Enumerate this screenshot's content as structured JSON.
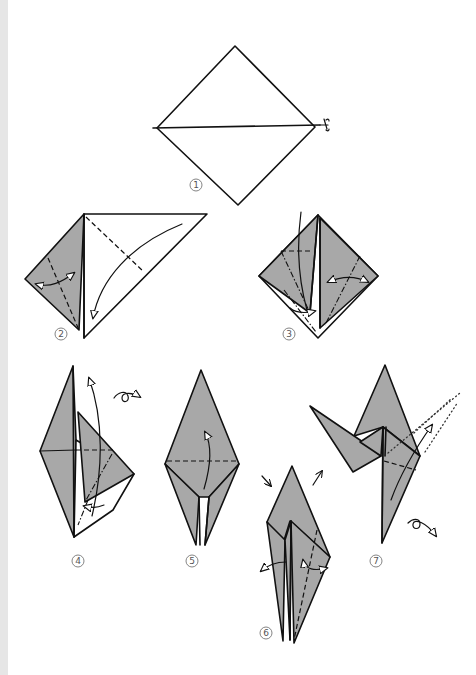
{
  "diagram": {
    "type": "origami instructions",
    "colors": {
      "paper_colored_side": "#a8a8a8",
      "paper_white_side": "#ffffff",
      "lines": "#111111",
      "page_edge": "#e6e6e6"
    },
    "steps": [
      {
        "number": "1",
        "symbols": [
          "diagonal crease",
          "scissors/cut mark"
        ]
      },
      {
        "number": "2",
        "symbols": [
          "valley fold",
          "fold arrow",
          "fold-and-unfold arrow"
        ]
      },
      {
        "number": "3",
        "symbols": [
          "valley fold",
          "mountain fold",
          "fold arrow",
          "fold-and-unfold arrow"
        ]
      },
      {
        "number": "4",
        "symbols": [
          "valley fold",
          "mountain fold",
          "fold arrow",
          "turn over symbol"
        ]
      },
      {
        "number": "5",
        "symbols": [
          "valley fold",
          "fold arrow"
        ]
      },
      {
        "number": "6",
        "symbols": [
          "valley fold",
          "push arrows",
          "open arrows"
        ]
      },
      {
        "number": "7",
        "symbols": [
          "valley fold",
          "dotted X-ray line",
          "fold arrow",
          "turn over symbol"
        ]
      }
    ]
  }
}
